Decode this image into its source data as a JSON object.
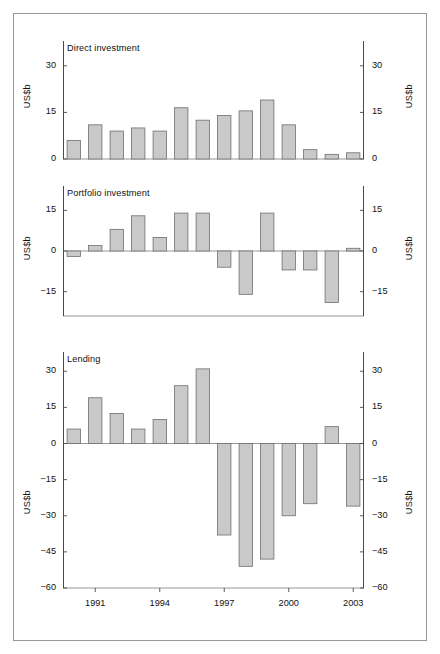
{
  "figure": {
    "units_label": "US$b",
    "x_tick_labels": [
      "1991",
      "1994",
      "1997",
      "2000",
      "2003"
    ],
    "x_tick_years": [
      1991,
      1994,
      1997,
      2000,
      2003
    ]
  },
  "chart_data": [
    {
      "type": "bar",
      "title": "Direct investment",
      "xlabel": "",
      "ylabel": "US$b",
      "ylim": [
        0,
        38
      ],
      "yticks": [
        0,
        15,
        30
      ],
      "ytick_labels": [
        "0",
        "15",
        "30"
      ],
      "grid": false,
      "legend": "none",
      "categories": [
        1990,
        1991,
        1992,
        1993,
        1994,
        1995,
        1996,
        1997,
        1998,
        1999,
        2000,
        2001,
        2002,
        2003
      ],
      "values": [
        6,
        11,
        9,
        10,
        9,
        16.5,
        12.5,
        14,
        15.5,
        19,
        11,
        3,
        1.5,
        2
      ]
    },
    {
      "type": "bar",
      "title": "Portfolio investment",
      "xlabel": "",
      "ylabel": "US$b",
      "ylim": [
        -24,
        24
      ],
      "yticks": [
        -15,
        0,
        15
      ],
      "ytick_labels": [
        "−15",
        "0",
        "15"
      ],
      "grid": false,
      "legend": "none",
      "categories": [
        1990,
        1991,
        1992,
        1993,
        1994,
        1995,
        1996,
        1997,
        1998,
        1999,
        2000,
        2001,
        2002,
        2003
      ],
      "values": [
        -2,
        2,
        8,
        13,
        5,
        14,
        14,
        -6,
        -16,
        14,
        -7,
        -7,
        -19,
        1
      ]
    },
    {
      "type": "bar",
      "title": "Lending",
      "xlabel": "",
      "ylabel": "US$b",
      "ylim": [
        -60,
        38
      ],
      "yticks": [
        -60,
        -45,
        -30,
        -15,
        0,
        15,
        30
      ],
      "ytick_labels": [
        "−60",
        "−45",
        "−30",
        "−15",
        "0",
        "15",
        "30"
      ],
      "grid": false,
      "legend": "none",
      "categories": [
        1990,
        1991,
        1992,
        1993,
        1994,
        1995,
        1996,
        1997,
        1998,
        1999,
        2000,
        2001,
        2002,
        2003
      ],
      "values": [
        6,
        19,
        12.5,
        6,
        10,
        24,
        31,
        -38,
        -51,
        -48,
        -30,
        -25,
        7,
        -26
      ]
    }
  ]
}
